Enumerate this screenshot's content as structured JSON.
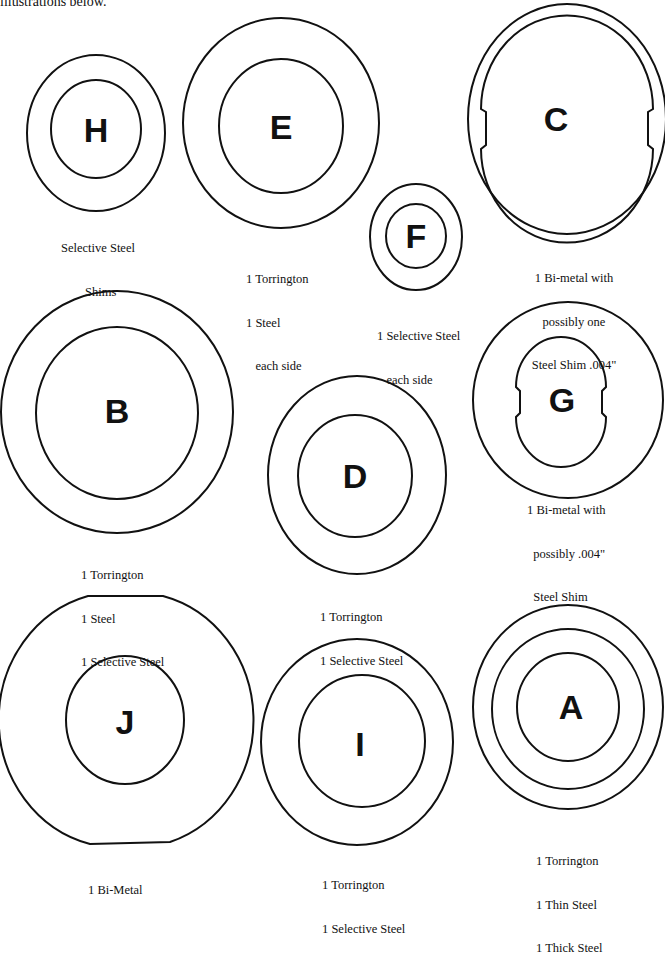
{
  "intro_text": "illustrations below.",
  "washers": [
    {
      "id": "H",
      "letter": "H",
      "label_lines": [
        "Selective Steel",
        "Shims"
      ]
    },
    {
      "id": "E",
      "letter": "E",
      "label_lines": [
        "1 Torrington",
        "1 Steel",
        "   each side"
      ]
    },
    {
      "id": "F",
      "letter": "F",
      "label_lines": [
        "1 Selective Steel",
        "   each side"
      ]
    },
    {
      "id": "C",
      "letter": "C",
      "label_lines": [
        "1 Bi-metal with",
        "possibly one",
        "Steel Shim .004\""
      ]
    },
    {
      "id": "B",
      "letter": "B",
      "label_lines": [
        "1 Torrington",
        "1 Steel",
        "1 Selective Steel"
      ]
    },
    {
      "id": "D",
      "letter": "D",
      "label_lines": [
        "1 Torrington",
        "1 Selective Steel"
      ]
    },
    {
      "id": "G",
      "letter": "G",
      "label_lines": [
        "1 Bi-metal with",
        "  possibly .004\"",
        "  Steel Shim"
      ]
    },
    {
      "id": "J",
      "letter": "J",
      "label_lines": [
        "1 Bi-Metal"
      ]
    },
    {
      "id": "I",
      "letter": "I",
      "label_lines": [
        "1 Torrington",
        "1 Selective Steel"
      ]
    },
    {
      "id": "A",
      "letter": "A",
      "label_lines": [
        "1 Torrington",
        "1 Thin Steel",
        "1 Thick Steel"
      ]
    }
  ]
}
